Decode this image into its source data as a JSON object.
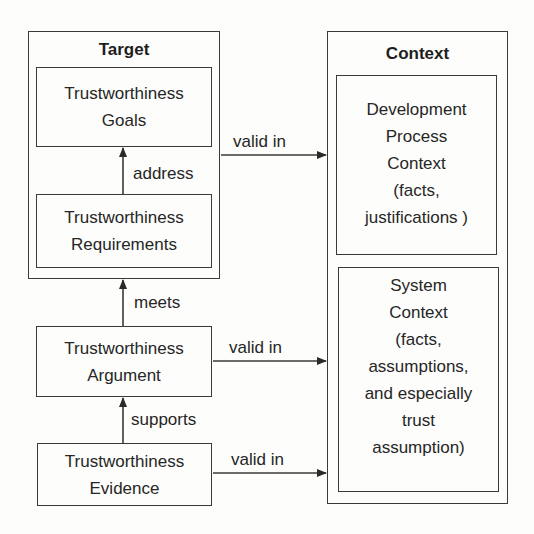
{
  "target": {
    "title": "Target",
    "goals": {
      "lines": [
        "Trustworthiness",
        "Goals"
      ]
    },
    "requirements": {
      "lines": [
        "Trustworthiness",
        "Requirements"
      ]
    }
  },
  "argument": {
    "lines": [
      "Trustworthiness",
      "Argument"
    ]
  },
  "evidence": {
    "lines": [
      "Trustworthiness",
      "Evidence"
    ]
  },
  "context": {
    "title": "Context",
    "development": {
      "lines": [
        "Development",
        "Process",
        "Context",
        "(facts,",
        "justifications )"
      ]
    },
    "system": {
      "lines": [
        "System",
        "Context",
        "(facts,",
        "assumptions,",
        "and especially",
        "trust",
        "assumption)"
      ]
    }
  },
  "edges": {
    "address": "address",
    "meets": "meets",
    "supports": "supports",
    "target_valid_in": "valid in",
    "argument_valid_in": "valid in",
    "evidence_valid_in": "valid in"
  }
}
